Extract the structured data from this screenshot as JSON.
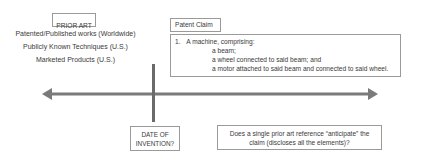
{
  "prior_art": {
    "title": "PRIOR ART",
    "items": [
      "Patented/Published works (Worldwide)",
      "Publicly Known Techniques (U.S.)",
      "Marketed Products (U.S.)"
    ]
  },
  "patent_claim": {
    "title": "Patent Claim",
    "number": "1.",
    "lead": "A machine, comprising:",
    "elements": [
      "a beam;",
      "a wheel connected to said beam; and",
      "a motor attached to said beam and connected to said wheel."
    ]
  },
  "timeline": {
    "date_label_line1": "DATE OF",
    "date_label_line2": "INVENTION?",
    "question_line1": "Does a single prior art reference “anticipate” the",
    "question_line2": "claim (discloses all the elements)?"
  },
  "colors": {
    "line": "#7a7a7a",
    "border": "#9a9a9a",
    "text": "#3a3a3a"
  }
}
